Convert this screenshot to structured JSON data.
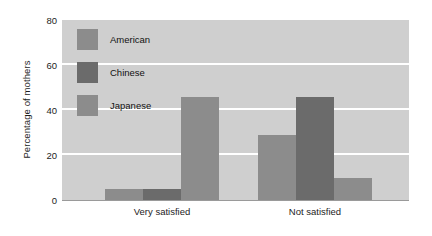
{
  "chart_data": {
    "type": "bar",
    "title": "",
    "xlabel": "",
    "ylabel": "Percentage of mothers",
    "categories": [
      "Very satisfied",
      "Not satisfied"
    ],
    "series": [
      {
        "name": "American",
        "values": [
          5,
          29
        ],
        "color": "#8c8c8c"
      },
      {
        "name": "Chinese",
        "values": [
          5,
          46
        ],
        "color": "#6b6b6b"
      },
      {
        "name": "Japanese",
        "values": [
          46,
          10
        ],
        "color": "#8c8c8c"
      }
    ],
    "ylim": [
      0,
      80
    ],
    "yticks": [
      0,
      20,
      40,
      60,
      80
    ],
    "ytick_labels": [
      "0",
      "20",
      "40",
      "60",
      "80"
    ],
    "grid": true,
    "grid_color": "#ffffff",
    "plot_background": "#cfcfcf",
    "legend_position": "upper-left-inside"
  },
  "axes": {
    "y_title": "Percentage of mothers",
    "y_tick_labels": [
      "80",
      "60",
      "40",
      "20",
      "0"
    ],
    "x_tick_labels": [
      "Very satisfied",
      "Not satisfied"
    ]
  },
  "legend": {
    "entries": [
      {
        "label": "American",
        "color": "#8c8c8c"
      },
      {
        "label": "Chinese",
        "color": "#6b6b6b"
      },
      {
        "label": "Japanese",
        "color": "#8c8c8c"
      }
    ]
  }
}
